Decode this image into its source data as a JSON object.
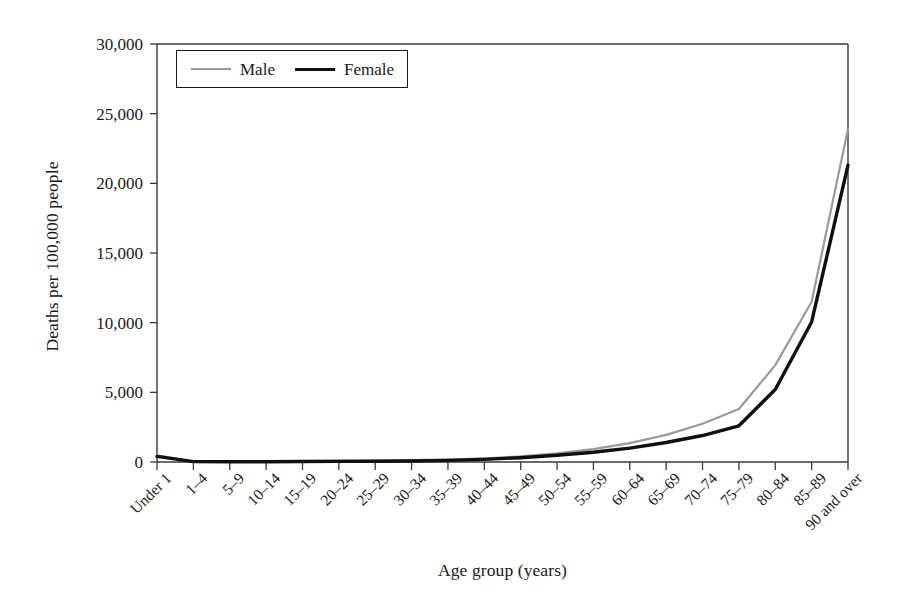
{
  "chart_data": {
    "type": "line",
    "title": "",
    "xlabel": "Age group (years)",
    "ylabel": "Deaths per 100,000 people",
    "categories": [
      "Under 1",
      "1–4",
      "5–9",
      "10–14",
      "15–19",
      "20–24",
      "25–29",
      "30–34",
      "35–39",
      "40–44",
      "45–49",
      "50–54",
      "55–59",
      "60–64",
      "65–69",
      "70–74",
      "75–79",
      "80–84",
      "85–89",
      "90 and over"
    ],
    "series": [
      {
        "name": "Male",
        "color": "#9a9a9a",
        "line_width": 2.2,
        "values": [
          480,
          35,
          20,
          25,
          60,
          95,
          105,
          130,
          175,
          260,
          400,
          620,
          930,
          1350,
          1950,
          2750,
          3800,
          6950,
          11500,
          23900
        ]
      },
      {
        "name": "Female",
        "color": "#101010",
        "line_width": 3.4,
        "values": [
          400,
          30,
          18,
          20,
          35,
          45,
          55,
          75,
          115,
          190,
          310,
          480,
          700,
          1000,
          1400,
          1900,
          2600,
          5200,
          10050,
          21300
        ]
      }
    ],
    "ylim": [
      0,
      30000
    ],
    "ytick_values": [
      0,
      5000,
      10000,
      15000,
      20000,
      25000,
      30000
    ],
    "ytick_labels": [
      "0",
      "5,000",
      "10,000",
      "15,000",
      "20,000",
      "25,000",
      "30,000"
    ],
    "grid": false,
    "legend_position": "top-left",
    "xtick_rotation": -45
  },
  "legend": {
    "entries": [
      {
        "label": "Male"
      },
      {
        "label": "Female"
      }
    ]
  },
  "axes": {
    "x_title": "Age group (years)",
    "y_title": "Deaths per 100,000 people"
  },
  "plot_geometry": {
    "left": 157,
    "right": 848,
    "top": 44,
    "bottom": 462
  },
  "colors": {
    "male_line": "#9a9a9a",
    "female_line": "#101010",
    "axis": "#3a3a3a",
    "background": "#ffffff"
  }
}
